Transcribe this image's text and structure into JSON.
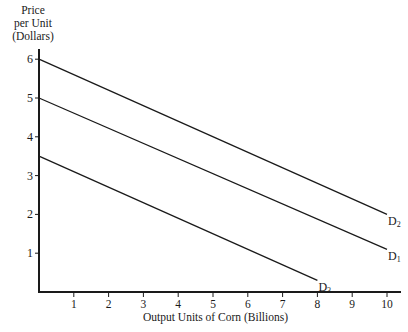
{
  "chart_data": {
    "type": "line",
    "title": "",
    "xlabel": "Output Units of Corn (Billions)",
    "ylabel": "Price per Unit (Dollars)",
    "ylabel_lines": [
      "Price",
      "per Unit",
      "(Dollars)"
    ],
    "xlim": [
      0,
      10.4
    ],
    "ylim": [
      0,
      6.3
    ],
    "x_ticks": [
      1,
      2,
      3,
      4,
      5,
      6,
      7,
      8,
      9,
      10
    ],
    "y_ticks": [
      1,
      2,
      3,
      4,
      5,
      6
    ],
    "grid": false,
    "legend": "none (curves labeled at right ends)",
    "series": [
      {
        "name": "D2",
        "label_main": "D",
        "label_sub": "2",
        "points": [
          [
            0,
            6
          ],
          [
            10,
            2
          ]
        ]
      },
      {
        "name": "D1",
        "label_main": "D",
        "label_sub": "1",
        "points": [
          [
            0,
            5
          ],
          [
            10,
            1.1
          ]
        ]
      },
      {
        "name": "D3",
        "label_main": "D",
        "label_sub": "3",
        "points": [
          [
            0,
            3.5
          ],
          [
            8,
            0.3
          ]
        ]
      }
    ]
  },
  "colors": {
    "ink": "#1a1a1a",
    "background": "#ffffff"
  }
}
